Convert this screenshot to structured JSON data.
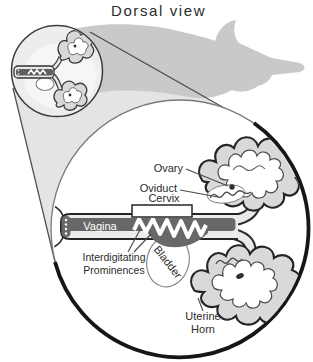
{
  "title": "Dorsal view",
  "labels": {
    "ovary": "Ovary",
    "oviduct": "Oviduct",
    "cervix": "Cervix",
    "vagina": "Vagina",
    "bladder": "Bladder",
    "interdigitating_line1": "Interdigitating",
    "interdigitating_line2": "Prominences",
    "uterine_horn_line1": "Uterine",
    "uterine_horn_line2": "Horn"
  },
  "colors": {
    "ink": "#252525",
    "ink2": "#4a4a4a",
    "label": "#2b2b2b",
    "silhouette": "#c9c9c9",
    "cone": "#e4e4e4",
    "circle_ring": "#161616",
    "wall": "#ececec",
    "horn_wall": "#d9d9d9",
    "lumen": "#686868",
    "inset_bg": "#ededed",
    "inset_body": "#f6f6f6"
  }
}
